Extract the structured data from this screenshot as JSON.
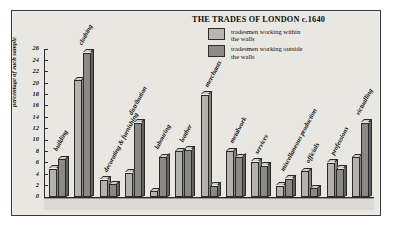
{
  "chart_data": {
    "type": "bar",
    "title": "THE TRADES OF LONDON c.1640",
    "xlabel": "",
    "ylabel": "percentage of each sample",
    "ylim": [
      0,
      26
    ],
    "ytick_step": 2,
    "yticks": [
      26,
      24,
      22,
      20,
      18,
      16,
      14,
      12,
      10,
      8,
      6,
      4,
      2,
      0
    ],
    "grid": false,
    "legend_position": "top-right",
    "categories": [
      "building",
      "clothing",
      "decorating & furnishing",
      "distribution",
      "labouring",
      "leather",
      "merchants",
      "metalwork",
      "services",
      "miscellaneous production",
      "officials",
      "professions",
      "victualling"
    ],
    "series": [
      {
        "name": "tradesmen working within the walls",
        "color": "#b4b2ad",
        "values": [
          5.0,
          20.5,
          3.0,
          4.3,
          1.0,
          8.0,
          18.0,
          8.0,
          6.2,
          2.0,
          4.5,
          6.0,
          7.0
        ]
      },
      {
        "name": "tradesmen working outside the walls",
        "color": "#8b8985",
        "values": [
          6.6,
          25.3,
          2.2,
          13.0,
          7.0,
          8.3,
          2.0,
          7.0,
          5.5,
          3.2,
          1.5,
          5.0,
          13.0
        ]
      }
    ]
  },
  "legend": {
    "items": [
      {
        "label_line1": "tradesmen working within",
        "label_line2": "the walls",
        "swatch": "sw-in"
      },
      {
        "label_line1": "tradesmen working outside",
        "label_line2": "the walls",
        "swatch": "sw-out"
      }
    ]
  }
}
